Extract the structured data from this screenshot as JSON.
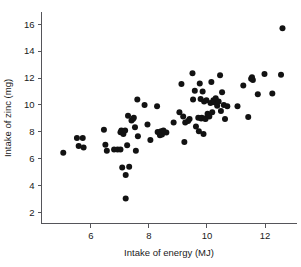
{
  "chart_data": {
    "type": "scatter",
    "title": "",
    "xlabel": "Intake of energy (MJ)",
    "ylabel": "Intake of zinc (mg)",
    "xlim": [
      4.3,
      13.1
    ],
    "ylim": [
      1.2,
      16.9
    ],
    "xticks": [
      6,
      8,
      10,
      12
    ],
    "yticks": [
      2,
      4,
      6,
      8,
      10,
      12,
      14,
      16
    ],
    "xtick_labels": [
      "6",
      "8",
      "10",
      "12"
    ],
    "ytick_labels": [
      "2",
      "4",
      "6",
      "8",
      "10",
      "12",
      "14",
      "16"
    ],
    "grid": false,
    "legend": null,
    "marker": "filled-circle",
    "marker_color": "#121212",
    "marker_size": 3.0,
    "series": [
      {
        "name": "subjects",
        "n": 91,
        "points": [
          [
            5.05,
            6.45
          ],
          [
            5.52,
            7.55
          ],
          [
            5.58,
            6.95
          ],
          [
            5.72,
            7.55
          ],
          [
            5.75,
            6.85
          ],
          [
            6.45,
            8.15
          ],
          [
            6.5,
            7.05
          ],
          [
            6.55,
            6.6
          ],
          [
            6.8,
            6.7
          ],
          [
            6.92,
            6.7
          ],
          [
            7.02,
            6.7
          ],
          [
            7.02,
            7.98
          ],
          [
            7.05,
            8.1
          ],
          [
            7.08,
            5.35
          ],
          [
            7.12,
            7.85
          ],
          [
            7.18,
            8.1
          ],
          [
            7.2,
            4.8
          ],
          [
            7.2,
            3.05
          ],
          [
            7.25,
            7.0
          ],
          [
            7.28,
            9.2
          ],
          [
            7.32,
            5.42
          ],
          [
            7.4,
            8.85
          ],
          [
            7.45,
            8.95
          ],
          [
            7.48,
            9.05
          ],
          [
            7.52,
            8.35
          ],
          [
            7.55,
            6.6
          ],
          [
            7.6,
            10.4
          ],
          [
            7.62,
            7.68
          ],
          [
            7.85,
            10.0
          ],
          [
            7.95,
            8.55
          ],
          [
            8.05,
            7.4
          ],
          [
            8.28,
            9.9
          ],
          [
            8.3,
            8.0
          ],
          [
            8.35,
            7.95
          ],
          [
            8.38,
            7.75
          ],
          [
            8.42,
            8.05
          ],
          [
            8.45,
            7.8
          ],
          [
            8.85,
            8.7
          ],
          [
            9.05,
            9.45
          ],
          [
            9.12,
            11.55
          ],
          [
            9.18,
            9.15
          ],
          [
            9.22,
            7.25
          ],
          [
            9.25,
            8.7
          ],
          [
            9.4,
            8.95
          ],
          [
            9.5,
            12.35
          ],
          [
            9.52,
            10.4
          ],
          [
            9.58,
            11.05
          ],
          [
            9.62,
            8.4
          ],
          [
            9.7,
            9.05
          ],
          [
            9.72,
            8.05
          ],
          [
            9.75,
            11.6
          ],
          [
            9.78,
            10.45
          ],
          [
            9.8,
            9.0
          ],
          [
            9.82,
            9.05
          ],
          [
            9.85,
            11.0
          ],
          [
            9.88,
            7.85
          ],
          [
            9.9,
            10.25
          ],
          [
            9.92,
            9.0
          ],
          [
            9.95,
            8.95
          ],
          [
            9.98,
            10.35
          ],
          [
            10.02,
            9.35
          ],
          [
            10.05,
            9.25
          ],
          [
            10.08,
            9.15
          ],
          [
            10.12,
            10.15
          ],
          [
            10.15,
            11.7
          ],
          [
            10.18,
            9.45
          ],
          [
            10.22,
            10.35
          ],
          [
            10.25,
            10.2
          ],
          [
            10.3,
            10.5
          ],
          [
            10.35,
            9.95
          ],
          [
            10.4,
            10.25
          ],
          [
            10.45,
            12.2
          ],
          [
            10.52,
            10.95
          ],
          [
            10.58,
            10.0
          ],
          [
            10.62,
            8.95
          ],
          [
            10.7,
            9.9
          ],
          [
            11.05,
            9.9
          ],
          [
            11.25,
            11.45
          ],
          [
            11.42,
            9.1
          ],
          [
            11.52,
            11.95
          ],
          [
            11.55,
            12.05
          ],
          [
            11.58,
            11.85
          ],
          [
            11.75,
            10.8
          ],
          [
            11.98,
            12.3
          ],
          [
            12.25,
            10.85
          ],
          [
            12.55,
            12.25
          ],
          [
            12.6,
            15.7
          ],
          [
            8.6,
            7.95
          ],
          [
            8.5,
            8.1
          ],
          [
            9.35,
            8.8
          ],
          [
            10.48,
            9.55
          ]
        ]
      }
    ]
  },
  "axes": {
    "x_title": "Intake of energy (MJ)",
    "y_title": "Intake of zinc (mg)"
  }
}
